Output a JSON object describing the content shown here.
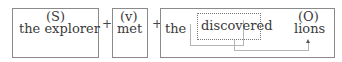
{
  "diagram": {
    "subject": {
      "tag": "(S)",
      "text": "the explorer"
    },
    "plus_1": "+",
    "verb": {
      "tag": "(v)",
      "text": "met"
    },
    "plus_2": "+",
    "object_phrase": {
      "article": "the",
      "modifier": "discovered",
      "tag": "(O)",
      "head": "lions"
    }
  },
  "colors": {
    "box_border": "#8a8a8a",
    "text": "#3a3a3a",
    "connector": "#b5b5b5"
  }
}
